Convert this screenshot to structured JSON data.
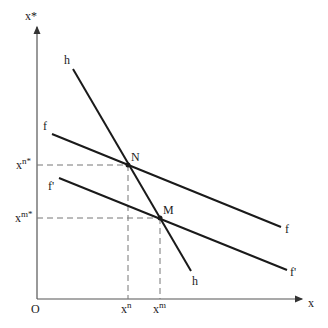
{
  "diagram": {
    "axes": {
      "y_label": "x*",
      "x_label": "x",
      "origin_label": "O"
    },
    "lines": [
      {
        "name": "h",
        "label_start": "h",
        "label_end": "h"
      },
      {
        "name": "f",
        "label_start": "f",
        "label_end": "f"
      },
      {
        "name": "f_prime",
        "label_start": "f'",
        "label_end": "f'"
      }
    ],
    "points": [
      {
        "name": "N",
        "label": "N"
      },
      {
        "name": "M",
        "label": "M"
      }
    ],
    "y_ticks": [
      {
        "base": "x",
        "sup": "n*"
      },
      {
        "base": "x",
        "sup": "m*"
      }
    ],
    "x_ticks": [
      {
        "base": "x",
        "sup": "n"
      },
      {
        "base": "x",
        "sup": "m"
      }
    ],
    "colors": {
      "line": "#1a1a1a",
      "axis": "#555555",
      "dashed": "#777777"
    }
  }
}
